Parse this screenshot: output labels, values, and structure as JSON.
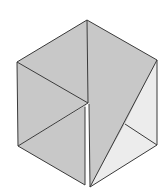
{
  "diagram": {
    "type": "hexagon-dissection",
    "colors": {
      "background": "#ffffff",
      "dark_fill": "#c8c8c8",
      "light_fill": "#ececec",
      "gap_fill": "#ffffff",
      "stroke": "#3a3a3a"
    },
    "vertices": {
      "top": [
        87,
        20
      ],
      "upper_left": [
        17,
        62
      ],
      "lower_left": [
        18,
        146
      ],
      "upper_right": [
        157,
        60
      ],
      "lower_right": [
        157,
        145
      ],
      "center": [
        88,
        103
      ],
      "bottom_gap_left": [
        85,
        185
      ],
      "bottom_gap_right": [
        90,
        187
      ],
      "inner_right": [
        125,
        124
      ]
    },
    "regions": [
      {
        "name": "top-left-quad",
        "points": "87,20 17,62 88,103",
        "shade": "dark"
      },
      {
        "name": "left-middle-triangle",
        "points": "17,62 18,146 88,103",
        "shade": "dark"
      },
      {
        "name": "left-bottom-triangle",
        "points": "18,146 86,105 85,185",
        "shade": "dark"
      },
      {
        "name": "central-tall-piece",
        "points": "87,20 157,60 125,124 90,187 89,104 88,103",
        "shade": "dark"
      },
      {
        "name": "right-light-triangle-upper",
        "points": "157,60 157,145 125,124",
        "shade": "light"
      },
      {
        "name": "right-light-triangle-lower",
        "points": "125,124 157,145 90,187",
        "shade": "light"
      },
      {
        "name": "white-gap",
        "points": "85,107 89,104 90,187 85,185",
        "shade": "gap"
      }
    ]
  }
}
